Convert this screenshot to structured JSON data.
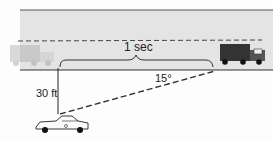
{
  "diagram": {
    "time_label": "1 sec",
    "angle_label": "15°",
    "distance_label": "30 ft",
    "colors": {
      "road": "#e4e4e4",
      "road_edge": "#333333",
      "truck_faded": "#c8c8c8",
      "truck": "#333333"
    }
  }
}
